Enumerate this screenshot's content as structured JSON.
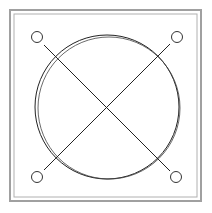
{
  "diagram": {
    "frame": {
      "outer": [
        10,
        10,
        191,
        191
      ],
      "inner": [
        14,
        14,
        183,
        183
      ],
      "stroke": "#9a9a9a"
    },
    "big_circle": {
      "cx": 108,
      "cy": 107,
      "r": 72,
      "stroke": "#222222"
    },
    "corner_circles": [
      {
        "cx": 37,
        "cy": 37,
        "r": 5
      },
      {
        "cx": 177,
        "cy": 37,
        "r": 5
      },
      {
        "cx": 37,
        "cy": 177,
        "r": 5
      },
      {
        "cx": 177,
        "cy": 177,
        "r": 5
      }
    ],
    "diagonals": [
      {
        "x1": 44,
        "y1": 45,
        "x2": 170,
        "y2": 171
      },
      {
        "x1": 170,
        "y1": 44,
        "x2": 44,
        "y2": 170
      }
    ]
  }
}
